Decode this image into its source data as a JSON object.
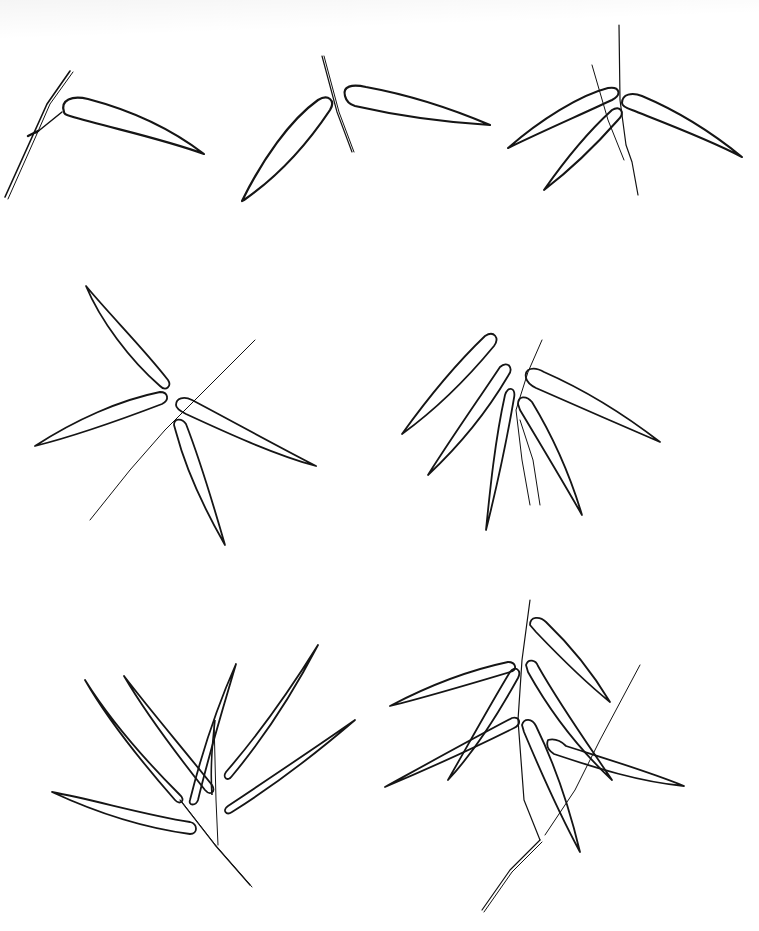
{
  "image": {
    "kind": "ink line drawing",
    "subject": "bamboo leaf arrangements",
    "background": "#ffffff",
    "ink_color": "#111111",
    "panels": [
      {
        "id": "panel-1",
        "row": 1,
        "col": 1,
        "leaves": 1
      },
      {
        "id": "panel-2",
        "row": 1,
        "col": 2,
        "leaves": 2
      },
      {
        "id": "panel-3",
        "row": 1,
        "col": 3,
        "leaves": 4
      },
      {
        "id": "panel-4",
        "row": 2,
        "col": 1,
        "leaves": 4
      },
      {
        "id": "panel-5",
        "row": 2,
        "col": 2,
        "leaves": 5
      },
      {
        "id": "panel-6",
        "row": 3,
        "col": 1,
        "leaves": 8
      },
      {
        "id": "panel-7",
        "row": 3,
        "col": 2,
        "leaves": 8
      }
    ]
  }
}
